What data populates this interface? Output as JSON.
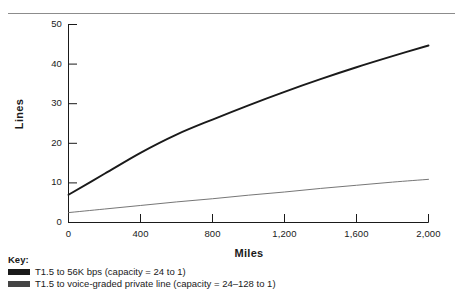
{
  "chart_data": {
    "type": "line",
    "title": "",
    "xlabel": "Miles",
    "ylabel": "Lines",
    "xlim": [
      0,
      2000
    ],
    "ylim": [
      0,
      50
    ],
    "grid": false,
    "legend_position": "below-left",
    "x_ticks": [
      "0",
      "400",
      "800",
      "1,200",
      "1,600",
      "2,000"
    ],
    "x_tick_values": [
      0,
      400,
      800,
      1200,
      1600,
      2000
    ],
    "y_ticks": [
      "0",
      "10",
      "20",
      "30",
      "40",
      "50"
    ],
    "y_tick_values": [
      0,
      10,
      20,
      30,
      40,
      50
    ],
    "series": [
      {
        "name": "T1.5 to 56K bps (capacity = 24 to 1)",
        "color": "#1a1a1a",
        "width": 1.9,
        "x": [
          0,
          200,
          400,
          600,
          800,
          1000,
          1200,
          1400,
          1600,
          1800,
          2000
        ],
        "values": [
          7.0,
          12.3,
          17.6,
          22.2,
          26.0,
          29.6,
          33.0,
          36.2,
          39.2,
          42.0,
          44.7
        ]
      },
      {
        "name": "T1.5 to voice-graded private line (capacity = 24–128 to 1)",
        "color": "#666666",
        "width": 0.9,
        "x": [
          0,
          200,
          400,
          600,
          800,
          1000,
          1200,
          1400,
          1600,
          1800,
          2000
        ],
        "values": [
          2.5,
          3.4,
          4.3,
          5.2,
          6.0,
          6.9,
          7.7,
          8.6,
          9.4,
          10.2,
          10.9
        ]
      }
    ]
  },
  "key": {
    "title": "Key:",
    "entries": [
      {
        "label": "T1.5 to 56K bps (capacity = 24 to 1)",
        "color": "#1a1a1a"
      },
      {
        "label": "T1.5 to voice-graded private line (capacity = 24–128 to 1)",
        "color": "#444444"
      }
    ]
  }
}
